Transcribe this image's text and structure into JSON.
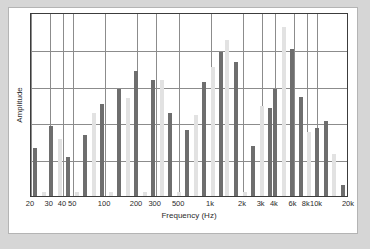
{
  "chart_data": {
    "type": "bar",
    "title": "",
    "xlabel": "Frequency (Hz)",
    "ylabel": "Amplitude",
    "grid": true,
    "legend": "none",
    "x_scale": "log",
    "xlim": [
      20,
      20000
    ],
    "ylim": [
      0,
      1
    ],
    "y_gridlines": [
      0.2,
      0.4,
      0.6,
      0.8
    ],
    "tick_labels": [
      "20",
      "30",
      "40",
      "50",
      "100",
      "200",
      "300",
      "500",
      "1k",
      "2k",
      "3k",
      "4k",
      "6k",
      "8k",
      "10k",
      "20k"
    ],
    "tick_frequencies": [
      20,
      30,
      40,
      50,
      100,
      200,
      300,
      500,
      1000,
      2000,
      3000,
      4000,
      6000,
      8000,
      10000,
      20000
    ],
    "gridline_frequencies": [
      20,
      30,
      40,
      50,
      100,
      200,
      300,
      500,
      1000,
      2000,
      3000,
      4000,
      6000,
      8000,
      10000,
      20000
    ],
    "series": [
      {
        "name": "dark",
        "color": "#6e6e6e",
        "values": [
          0.26,
          0.38,
          0.21,
          0.33,
          0.5,
          0.58,
          0.68,
          0.63,
          0.45,
          0.36,
          0.62,
          0.78,
          0.85,
          0.73,
          0.27,
          0.48,
          0.58,
          0.8,
          0.54,
          0.37,
          0.33,
          0.41,
          0.06
        ]
      },
      {
        "name": "light",
        "color": "#e2e2e2",
        "values": [
          0.02,
          0.31,
          0.02,
          0.45,
          0.53,
          0.63,
          0.7,
          0.33,
          0.49,
          0.74,
          0.8,
          0.92,
          0.44,
          0.35,
          0.23,
          0.02
        ]
      }
    ],
    "bars": [
      {
        "x": 2,
        "h": 0.26,
        "c": "dark"
      },
      {
        "x": 13,
        "h": 0.02,
        "c": "light"
      },
      {
        "x": 22,
        "h": 0.38,
        "c": "dark"
      },
      {
        "x": 33,
        "h": 0.31,
        "c": "light"
      },
      {
        "x": 43,
        "h": 0.21,
        "c": "dark"
      },
      {
        "x": 54,
        "h": 0.02,
        "c": "light"
      },
      {
        "x": 64,
        "h": 0.33,
        "c": "dark"
      },
      {
        "x": 75,
        "h": 0.45,
        "c": "light"
      },
      {
        "x": 85,
        "h": 0.5,
        "c": "dark"
      },
      {
        "x": 96,
        "h": 0.02,
        "c": "light"
      },
      {
        "x": 106,
        "h": 0.58,
        "c": "dark"
      },
      {
        "x": 117,
        "h": 0.53,
        "c": "light"
      },
      {
        "x": 127,
        "h": 0.68,
        "c": "dark"
      },
      {
        "x": 138,
        "h": 0.02,
        "c": "light"
      },
      {
        "x": 148,
        "h": 0.63,
        "c": "dark"
      },
      {
        "x": 159,
        "h": 0.63,
        "c": "light"
      },
      {
        "x": 169,
        "h": 0.45,
        "c": "dark"
      },
      {
        "x": 180,
        "h": 0.02,
        "c": "light"
      },
      {
        "x": 190,
        "h": 0.36,
        "c": "dark"
      },
      {
        "x": 201,
        "h": 0.44,
        "c": "light"
      },
      {
        "x": 211,
        "h": 0.62,
        "c": "dark"
      },
      {
        "x": 222,
        "h": 0.7,
        "c": "light"
      },
      {
        "x": 232,
        "h": 0.78,
        "c": "dark"
      },
      {
        "x": 240,
        "h": 0.85,
        "c": "light"
      },
      {
        "x": 251,
        "h": 0.73,
        "c": "dark"
      },
      {
        "x": 262,
        "h": 0.02,
        "c": "light"
      },
      {
        "x": 272,
        "h": 0.27,
        "c": "dark"
      },
      {
        "x": 283,
        "h": 0.49,
        "c": "light"
      },
      {
        "x": 293,
        "h": 0.48,
        "c": "dark"
      },
      {
        "x": 299,
        "h": 0.58,
        "c": "dark"
      },
      {
        "x": 310,
        "h": 0.92,
        "c": "light"
      },
      {
        "x": 320,
        "h": 0.8,
        "c": "dark"
      },
      {
        "x": 331,
        "h": 0.54,
        "c": "dark"
      },
      {
        "x": 341,
        "h": 0.35,
        "c": "light"
      },
      {
        "x": 351,
        "h": 0.37,
        "c": "dark"
      },
      {
        "x": 362,
        "h": 0.41,
        "c": "dark"
      },
      {
        "x": 372,
        "h": 0.23,
        "c": "light"
      },
      {
        "x": 383,
        "h": 0.06,
        "c": "dark"
      }
    ]
  },
  "axis": {
    "x_title": "Frequency (Hz)",
    "y_title": "Amplitude"
  },
  "colors": {
    "bar_dark": "#6e6e6e",
    "bar_light": "#e2e2e2",
    "grid": "#8c8c8c",
    "frame": "#3c3c3c",
    "card_bg": "#ffffff",
    "page_bg": "#d6d6d6"
  }
}
